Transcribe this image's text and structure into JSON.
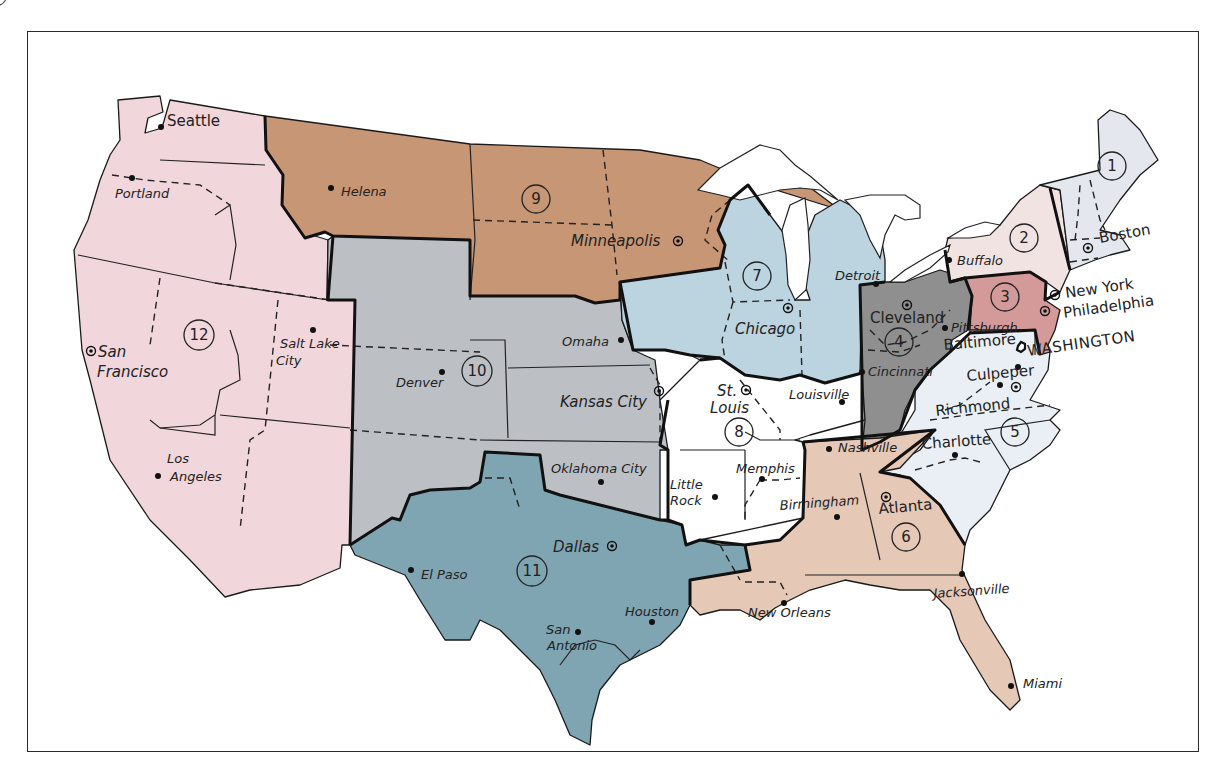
{
  "map": {
    "subject": "Federal Reserve Districts of the United States",
    "colors": {
      "d1": "#e4e8ee",
      "d2": "#f1e3e1",
      "d3": "#d49a9a",
      "d4": "#8f8f8f",
      "d5": "#e9eff4",
      "d6": "#e6c8b6",
      "d7": "#bcd3e0",
      "d8": "#ffffff",
      "d9": "#c79675",
      "d10": "#bcc0c5",
      "d11": "#7fa4b2",
      "d12": "#f1d6db",
      "border": "#111111",
      "frame": "#2a2a2a"
    },
    "districts": [
      {
        "number": "1",
        "reserve_bank": "Boston"
      },
      {
        "number": "2",
        "reserve_bank": "New York"
      },
      {
        "number": "3",
        "reserve_bank": "Philadelphia"
      },
      {
        "number": "4",
        "reserve_bank": "Cleveland"
      },
      {
        "number": "5",
        "reserve_bank": "Richmond"
      },
      {
        "number": "6",
        "reserve_bank": "Atlanta"
      },
      {
        "number": "7",
        "reserve_bank": "Chicago"
      },
      {
        "number": "8",
        "reserve_bank": "St. Louis"
      },
      {
        "number": "9",
        "reserve_bank": "Minneapolis"
      },
      {
        "number": "10",
        "reserve_bank": "Kansas City"
      },
      {
        "number": "11",
        "reserve_bank": "Dallas"
      },
      {
        "number": "12",
        "reserve_bank": "San Francisco"
      }
    ],
    "capital": "WASHINGTON",
    "reserve_cities": [
      "Boston",
      "New York",
      "Philadelphia",
      "Cleveland",
      "Richmond",
      "Atlanta",
      "Chicago",
      "St. Louis",
      "Minneapolis",
      "Kansas City",
      "Dallas",
      "San Francisco"
    ],
    "branch_cities": [
      "Seattle",
      "Portland",
      "Helena",
      "Salt Lake City",
      "Los Angeles",
      "Denver",
      "Omaha",
      "Oklahoma City",
      "El Paso",
      "San Antonio",
      "Houston",
      "Little Rock",
      "Memphis",
      "Louisville",
      "Nashville",
      "Birmingham",
      "New Orleans",
      "Jacksonville",
      "Miami",
      "Charlotte",
      "Baltimore",
      "Culpeper",
      "Cincinnati",
      "Pittsburgh",
      "Buffalo",
      "Detroit"
    ],
    "labels": {
      "seattle": "Seattle",
      "portland": "Portland",
      "helena": "Helena",
      "san_francisco_1": "San",
      "san_francisco_2": "Francisco",
      "salt_lake_1": "Salt Lake",
      "salt_lake_2": "City",
      "los_angeles_1": "Los",
      "los_angeles_2": "Angeles",
      "denver": "Denver",
      "omaha": "Omaha",
      "kansas_city": "Kansas City",
      "oklahoma_city": "Oklahoma City",
      "minneapolis": "Minneapolis",
      "el_paso": "El Paso",
      "dallas": "Dallas",
      "san_antonio_1": "San",
      "san_antonio_2": "Antonio",
      "houston": "Houston",
      "little_rock_1": "Little",
      "little_rock_2": "Rock",
      "memphis": "Memphis",
      "st_louis_1": "St.",
      "st_louis_2": "Louis",
      "louisville": "Louisville",
      "chicago": "Chicago",
      "detroit": "Detroit",
      "cleveland": "Cleveland",
      "cincinnati": "Cincinnati",
      "pittsburgh": "Pittsburgh",
      "buffalo": "Buffalo",
      "boston": "Boston",
      "new_york": "New York",
      "philadelphia": "Philadelphia",
      "washington": "WASHINGTON",
      "baltimore": "Baltimore",
      "culpeper": "Culpeper",
      "richmond": "Richmond",
      "charlotte": "Charlotte",
      "nashville": "Nashville",
      "birmingham": "Birmingham",
      "atlanta": "Atlanta",
      "new_orleans": "New Orleans",
      "jacksonville": "Jacksonville",
      "miami": "Miami"
    }
  }
}
